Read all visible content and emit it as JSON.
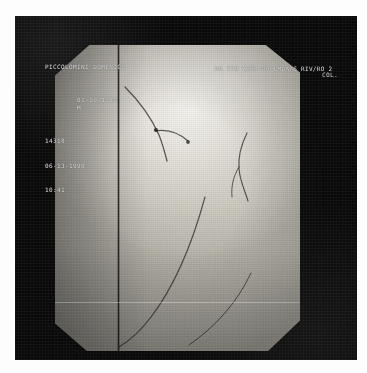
{
  "image": {
    "modality": "fluoroscopy-angiogram",
    "description": "Coronary angiography cine frame with burned-in patient overlay",
    "frame_color": "#090909",
    "field_color": "#dedbd3",
    "overlay_text_color": "#e9e9e9"
  },
  "overlay": {
    "patient": {
      "name": "PICCOLOMINI DOMENICO",
      "birth_date": "01-09-1950",
      "sex": "M",
      "record_id": "14318",
      "exam_date": "06-13-1998",
      "exam_time": "10:41"
    },
    "acquisition": {
      "header": "RR 770 WW78'90 LMDA/S RIV/RO 2",
      "projection_label": "COL."
    }
  },
  "annotations": {
    "catheter_label": "catheter-line",
    "vessel_label": "vessel-trace",
    "scanline_label": "horizontal-scanline"
  }
}
